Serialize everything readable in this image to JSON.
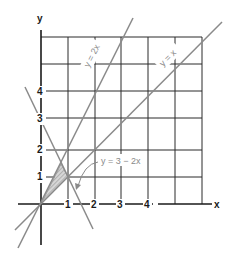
{
  "diagram": {
    "axes": {
      "x_label": "x",
      "y_label": "y"
    },
    "x_ticks": [
      "1",
      "2",
      "3",
      "4"
    ],
    "y_ticks": [
      "1",
      "2",
      "3",
      "4"
    ],
    "lines": [
      {
        "label": "y = 2x",
        "equation": "y=2x"
      },
      {
        "label": "y = x",
        "equation": "y=x"
      },
      {
        "label": "y = 3 − 2x",
        "equation": "y=3-2x"
      }
    ],
    "shaded_region": {
      "vertices": [
        [
          0,
          0
        ],
        [
          0.75,
          1.5
        ],
        [
          1,
          1
        ]
      ],
      "description": "triangle bounded by y=2x, y=x, y=3-2x"
    },
    "colors": {
      "grid": "#2a2a2a",
      "lines": "#8a8a8a",
      "shade": "#bdbdbd"
    }
  }
}
